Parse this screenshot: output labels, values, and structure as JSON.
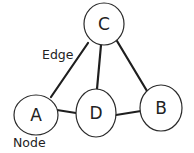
{
  "diagram": {
    "type": "graph",
    "nodes": [
      {
        "id": "C",
        "label": "C",
        "cx": 104,
        "cy": 24,
        "rx": 20,
        "ry": 21
      },
      {
        "id": "A",
        "label": "A",
        "cx": 36,
        "cy": 115,
        "rx": 21,
        "ry": 20
      },
      {
        "id": "D",
        "label": "D",
        "cx": 96,
        "cy": 113,
        "rx": 20,
        "ry": 24
      },
      {
        "id": "B",
        "label": "B",
        "cx": 161,
        "cy": 108,
        "rx": 21,
        "ry": 23
      }
    ],
    "edges": [
      {
        "from": "C",
        "to": "A"
      },
      {
        "from": "C",
        "to": "D"
      },
      {
        "from": "C",
        "to": "B"
      },
      {
        "from": "A",
        "to": "D"
      },
      {
        "from": "D",
        "to": "B"
      }
    ],
    "annotations": {
      "edge_label": "Edge",
      "node_label": "Node"
    }
  }
}
